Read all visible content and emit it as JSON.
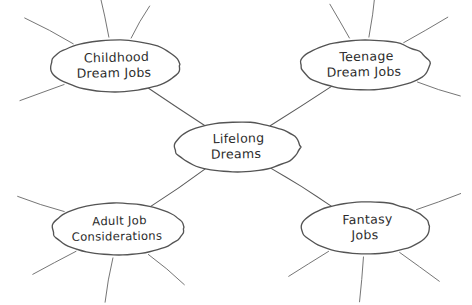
{
  "diagram": {
    "type": "mind-map",
    "background_color": "#ffffff",
    "stroke_color": "#545454",
    "text_color": "#2b2b2b",
    "style": "hand-drawn",
    "center_node": {
      "id": "lifelong-dreams",
      "lines": [
        "Lifelong",
        "Dreams"
      ],
      "cx": 237,
      "cy": 147,
      "rx": 63,
      "ry": 25
    },
    "branch_nodes": [
      {
        "id": "childhood-dream-jobs",
        "lines": [
          "Childhood",
          "Dream Jobs"
        ],
        "cx": 115,
        "cy": 66,
        "rx": 65,
        "ry": 26,
        "spokes": [
          {
            "angle_deg": 208,
            "length": 58
          },
          {
            "angle_deg": 258,
            "length": 46
          },
          {
            "angle_deg": 300,
            "length": 40
          },
          {
            "angle_deg": 160,
            "length": 50
          }
        ]
      },
      {
        "id": "teenage-dream-jobs",
        "lines": [
          "Teenage",
          "Dream Jobs"
        ],
        "cx": 365,
        "cy": 65,
        "rx": 65,
        "ry": 25,
        "spokes": [
          {
            "angle_deg": 240,
            "length": 42
          },
          {
            "angle_deg": 278,
            "length": 48
          },
          {
            "angle_deg": 330,
            "length": 54
          },
          {
            "angle_deg": 18,
            "length": 48
          }
        ]
      },
      {
        "id": "adult-job-considerations",
        "lines": [
          "Adult Job",
          "Considerations"
        ],
        "cx": 118,
        "cy": 229,
        "rx": 66,
        "ry": 26,
        "spokes": [
          {
            "angle_deg": 198,
            "length": 52
          },
          {
            "angle_deg": 152,
            "length": 52
          },
          {
            "angle_deg": 100,
            "length": 48
          },
          {
            "angle_deg": 40,
            "length": 50
          }
        ]
      },
      {
        "id": "fantasy-jobs",
        "lines": [
          "Fantasy",
          "Jobs"
        ],
        "cx": 366,
        "cy": 228,
        "rx": 64,
        "ry": 26,
        "spokes": [
          {
            "angle_deg": 340,
            "length": 50
          },
          {
            "angle_deg": 148,
            "length": 50
          },
          {
            "angle_deg": 95,
            "length": 48
          },
          {
            "angle_deg": 36,
            "length": 52
          }
        ]
      }
    ],
    "connectors": [
      {
        "id": "center-to-childhood",
        "from": "lifelong-dreams",
        "to": "childhood-dream-jobs"
      },
      {
        "id": "center-to-teenage",
        "from": "lifelong-dreams",
        "to": "teenage-dream-jobs"
      },
      {
        "id": "center-to-adult",
        "from": "lifelong-dreams",
        "to": "adult-job-considerations"
      },
      {
        "id": "center-to-fantasy",
        "from": "lifelong-dreams",
        "to": "fantasy-jobs"
      }
    ]
  }
}
